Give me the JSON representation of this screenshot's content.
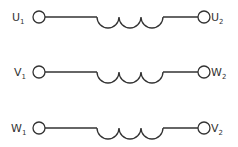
{
  "diagram": {
    "colors": {
      "stroke": "#333333",
      "background": "#ffffff"
    },
    "windings": [
      {
        "left": {
          "letter": "U",
          "sub": "1"
        },
        "right": {
          "letter": "U",
          "sub": "2"
        },
        "y": 17
      },
      {
        "left": {
          "letter": "V",
          "sub": "1"
        },
        "right": {
          "letter": "W",
          "sub": "2"
        },
        "y": 72
      },
      {
        "left": {
          "letter": "W",
          "sub": "1"
        },
        "right": {
          "letter": "V",
          "sub": "2"
        },
        "y": 128
      }
    ]
  }
}
